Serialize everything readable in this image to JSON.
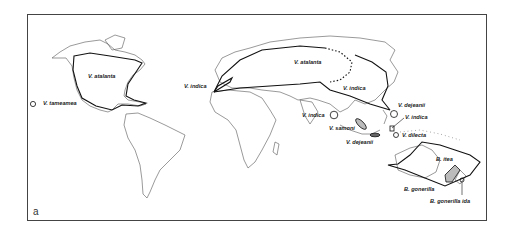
{
  "figure": {
    "panel_letter": "a",
    "type": "world distribution map",
    "colors": {
      "outline": "#444444",
      "range_line": "#111111",
      "background": "#ffffff"
    }
  },
  "labels": [
    {
      "id": "v-tameamea",
      "text": "V. tameamea",
      "x": 43,
      "y": 101
    },
    {
      "id": "v-atalanta-americas",
      "text": "V. atalanta",
      "x": 88,
      "y": 74
    },
    {
      "id": "v-indica-west",
      "text": "V. indica",
      "x": 184,
      "y": 84
    },
    {
      "id": "v-atalanta-eurasia",
      "text": "V. atalanta",
      "x": 294,
      "y": 60
    },
    {
      "id": "v-indica-east-asia",
      "text": "V. indica",
      "x": 343,
      "y": 86
    },
    {
      "id": "v-indica-india",
      "text": "V. indica",
      "x": 302,
      "y": 113
    },
    {
      "id": "v-samoni",
      "text": "V. samoni",
      "x": 329,
      "y": 126
    },
    {
      "id": "v-dejeanii-north",
      "text": "V. dejeanii",
      "x": 398,
      "y": 103
    },
    {
      "id": "v-indica-philippines",
      "text": "V. indica",
      "x": 405,
      "y": 115
    },
    {
      "id": "v-dejeanii-south",
      "text": "V. dejeanii",
      "x": 346,
      "y": 140
    },
    {
      "id": "v-dilecta",
      "text": "V. dilecta",
      "x": 402,
      "y": 133
    },
    {
      "id": "b-itea",
      "text": "B. itea",
      "x": 436,
      "y": 157
    },
    {
      "id": "b-gonerilla",
      "text": "B. gonerilla",
      "x": 404,
      "y": 187
    },
    {
      "id": "b-gonerilla-ida",
      "text": "B. gonerilla ida",
      "x": 430,
      "y": 199
    }
  ]
}
